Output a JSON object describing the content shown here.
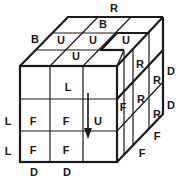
{
  "diagram": {
    "type": "rubiks-cube-3x3-oblique",
    "colors": {
      "line": "#1a1a1a",
      "background": "#ffffff"
    },
    "top_labels": [
      {
        "text": "R",
        "x": 114,
        "y": 8
      },
      {
        "text": "B",
        "x": 103,
        "y": 24
      },
      {
        "text": "B",
        "x": 35,
        "y": 39
      },
      {
        "text": "U",
        "x": 61,
        "y": 40
      },
      {
        "text": "U",
        "x": 93,
        "y": 40
      },
      {
        "text": "U",
        "x": 126,
        "y": 40
      },
      {
        "text": "U",
        "x": 76,
        "y": 56
      }
    ],
    "front_labels": [
      {
        "text": "L",
        "x": 68,
        "y": 87
      },
      {
        "text": "F",
        "x": 33,
        "y": 121
      },
      {
        "text": "F",
        "x": 66,
        "y": 121
      },
      {
        "text": "U",
        "x": 98,
        "y": 121
      },
      {
        "text": "F",
        "x": 33,
        "y": 150
      },
      {
        "text": "F",
        "x": 66,
        "y": 150
      }
    ],
    "side_labels": [
      {
        "text": "R",
        "x": 140,
        "y": 64
      },
      {
        "text": "R",
        "x": 157,
        "y": 80
      },
      {
        "text": "F",
        "x": 123,
        "y": 107
      },
      {
        "text": "R",
        "x": 141,
        "y": 99
      },
      {
        "text": "R",
        "x": 157,
        "y": 114
      },
      {
        "text": "D",
        "x": 171,
        "y": 71
      },
      {
        "text": "D",
        "x": 171,
        "y": 105
      },
      {
        "text": "F",
        "x": 157,
        "y": 136
      },
      {
        "text": "F",
        "x": 142,
        "y": 153
      }
    ],
    "outer_labels": [
      {
        "text": "L",
        "x": 8,
        "y": 121
      },
      {
        "text": "L",
        "x": 8,
        "y": 151
      },
      {
        "text": "D",
        "x": 34,
        "y": 172
      },
      {
        "text": "D",
        "x": 67,
        "y": 172
      }
    ],
    "arrow": {
      "direction": "down",
      "x": 88,
      "y1": 93,
      "y2": 138
    }
  }
}
